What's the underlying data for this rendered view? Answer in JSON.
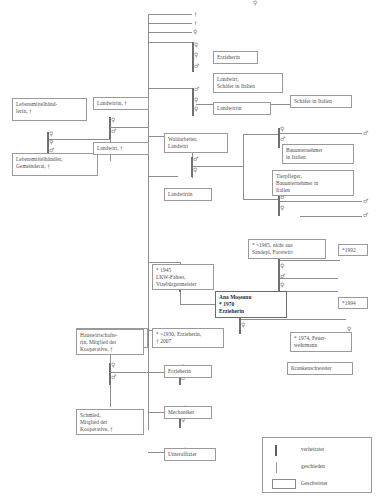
{
  "diagram": {
    "symbols": {
      "male": "♂",
      "female": "♀",
      "deceased": "†"
    },
    "top_marker": "♀",
    "boxes": [
      {
        "id": "b01",
        "text": "Lebensmittelhänd-\nlerin, †"
      },
      {
        "id": "b02",
        "text": "Lebensmittelhändler,\nGemeinderat, †"
      },
      {
        "id": "b03",
        "text": "Landwirtin, †"
      },
      {
        "id": "b04",
        "text": "Landwirt, †"
      },
      {
        "id": "b05",
        "text": "Erzieherin"
      },
      {
        "id": "b06",
        "text": "Landwirt;\nSchäfer in Italien"
      },
      {
        "id": "b07",
        "text": "Landwirtin"
      },
      {
        "id": "b08",
        "text": "Schäfer in Italien"
      },
      {
        "id": "b09",
        "text": "Waldarbeiter,\nLandwirt"
      },
      {
        "id": "b10",
        "text": "Landwirtin"
      },
      {
        "id": "b11",
        "text": "Bauunternehmer\nin Italien"
      },
      {
        "id": "b12",
        "text": "Tierpfleger,\nBauunternehmer in\nItalien"
      },
      {
        "id": "b13",
        "text": "* ~1965, nicht aus\nSandepi, Forstwirt"
      },
      {
        "id": "b14",
        "text": "*1992"
      },
      {
        "id": "b15",
        "text": "* 1945\nLKW-Fahrer,\nVizebürgermeister"
      },
      {
        "id": "b16",
        "text": "Ana Moşeanu\n* 1970\nErzieherin"
      },
      {
        "id": "b17",
        "text": "*1994"
      },
      {
        "id": "b18",
        "text": "* ~1930, Erzieherin,\n† 2007"
      },
      {
        "id": "b19",
        "text": "* 1974, Feuer-\nwehrmann"
      },
      {
        "id": "b20",
        "text": "Krankenschwester"
      },
      {
        "id": "b21",
        "text": "Hauswirtschafte-\nrin, Mitglied der\nKooperative, †"
      },
      {
        "id": "b22",
        "text": "Erzieherin"
      },
      {
        "id": "b23",
        "text": "Schmied,\nMitglied der\nKooperative, †"
      },
      {
        "id": "b24",
        "text": "Mechaniker"
      },
      {
        "id": "b25",
        "text": "Unteroffizier"
      }
    ],
    "legend": {
      "married_label": "verheiratet",
      "divorced_label": "geschieden",
      "sibling_label": "Geschwister"
    }
  }
}
